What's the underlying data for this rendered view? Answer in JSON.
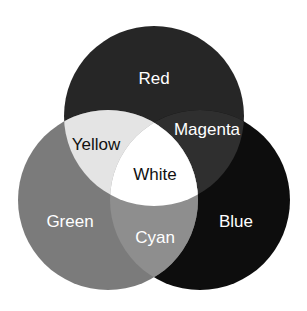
{
  "diagram": {
    "type": "venn",
    "title": "",
    "colors": {
      "red": "#262626",
      "green": "#7b7b7b",
      "blue": "#0d0d0d",
      "yellow": "#e4e4e4",
      "magenta": "#2f2f2f",
      "cyan": "#8e8e8e",
      "white": "#ffffff"
    },
    "labels": {
      "red": "Red",
      "green": "Green",
      "blue": "Blue",
      "yellow": "Yellow",
      "magenta": "Magenta",
      "cyan": "Cyan",
      "white": "White"
    }
  }
}
